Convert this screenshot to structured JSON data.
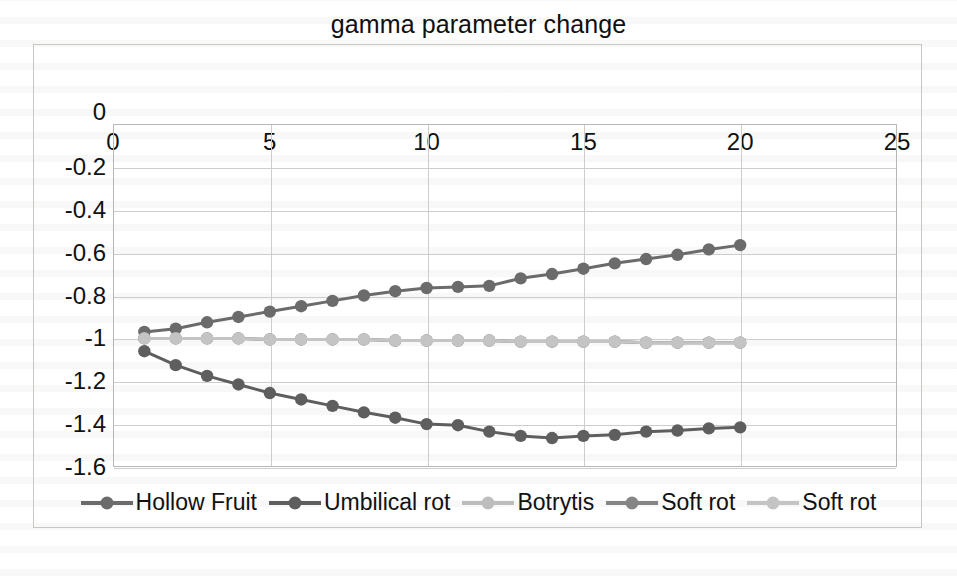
{
  "chart_data": {
    "type": "line",
    "title": "gamma parameter change",
    "xlabel": "",
    "ylabel": "",
    "xlim": [
      0,
      25
    ],
    "ylim": [
      -1.6,
      0
    ],
    "xticks": [
      0,
      5,
      10,
      15,
      20,
      25
    ],
    "yticks": [
      0,
      -0.2,
      -0.4,
      -0.6,
      -0.8,
      -1,
      -1.2,
      -1.4,
      -1.6
    ],
    "ytick_labels": [
      "0",
      "-0.2",
      "-0.4",
      "-0.6",
      "-0.8",
      "-1",
      "-1.2",
      "-1.4",
      "-1.6"
    ],
    "xtick_labels": [
      "0",
      "5",
      "10",
      "15",
      "20",
      "25"
    ],
    "grid": true,
    "legend_position": "bottom",
    "x": [
      1,
      2,
      3,
      4,
      5,
      6,
      7,
      8,
      9,
      10,
      11,
      12,
      13,
      14,
      15,
      16,
      17,
      18,
      19,
      20
    ],
    "series": [
      {
        "name": "Hollow Fruit",
        "color": "#6b6b6b",
        "values": [
          -0.97,
          -0.955,
          -0.925,
          -0.9,
          -0.875,
          -0.85,
          -0.825,
          -0.8,
          -0.78,
          -0.765,
          -0.76,
          -0.755,
          -0.72,
          -0.7,
          -0.675,
          -0.65,
          -0.63,
          -0.61,
          -0.585,
          -0.565
        ]
      },
      {
        "name": "Umbilical rot",
        "color": "#5e5e5e",
        "values": [
          -1.06,
          -1.125,
          -1.175,
          -1.215,
          -1.255,
          -1.285,
          -1.315,
          -1.345,
          -1.37,
          -1.4,
          -1.405,
          -1.435,
          -1.455,
          -1.465,
          -1.455,
          -1.45,
          -1.435,
          -1.43,
          -1.42,
          -1.415
        ]
      },
      {
        "name": "Botrytis",
        "color": "#bdbdbd",
        "values": [
          -1.0,
          -1.0,
          -1.0,
          -1.0,
          -1.005,
          -1.005,
          -1.005,
          -1.005,
          -1.01,
          -1.01,
          -1.01,
          -1.01,
          -1.015,
          -1.015,
          -1.015,
          -1.015,
          -1.02,
          -1.02,
          -1.02,
          -1.02
        ]
      },
      {
        "name": "Soft rot",
        "color": "#858585",
        "values": [
          -1.0,
          -1.0,
          -1.0,
          -1.0,
          -1.005,
          -1.005,
          -1.005,
          -1.005,
          -1.01,
          -1.01,
          -1.01,
          -1.01,
          -1.015,
          -1.015,
          -1.015,
          -1.015,
          -1.02,
          -1.02,
          -1.02,
          -1.02
        ]
      },
      {
        "name": "Soft rot",
        "color": "#c4c4c4",
        "values": [
          -1.0,
          -1.0,
          -1.0,
          -1.0,
          -1.005,
          -1.005,
          -1.005,
          -1.005,
          -1.01,
          -1.01,
          -1.01,
          -1.01,
          -1.015,
          -1.015,
          -1.015,
          -1.015,
          -1.02,
          -1.02,
          -1.02,
          -1.02
        ]
      }
    ]
  }
}
